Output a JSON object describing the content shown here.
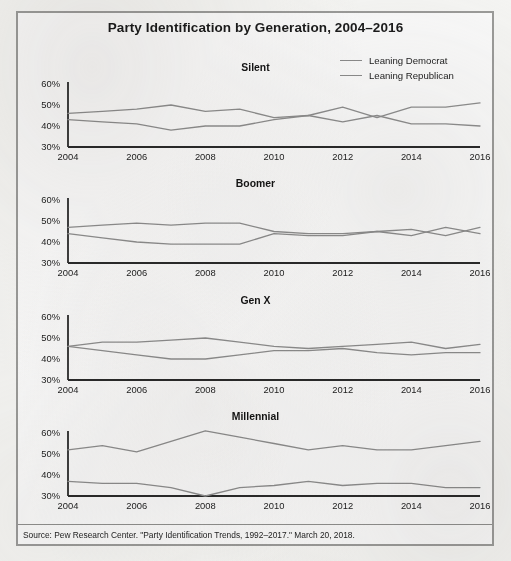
{
  "figure": {
    "title": "Party Identification by Generation, 2004–2016",
    "source": "Source: Pew Research Center. \"Party Identification Trends, 1992–2017.\" March 20, 2018."
  },
  "legend": {
    "items": [
      {
        "label": "Leaning Democrat",
        "color": "#8b8b8b"
      },
      {
        "label": "Leaning Republican",
        "color": "#8b8b8b"
      }
    ]
  },
  "chart_data": {
    "type": "line",
    "title": "Party Identification by Generation, 2004–2016",
    "xlabel": "",
    "ylabel": "",
    "xlim": [
      2004,
      2016
    ],
    "ylim": [
      30,
      60
    ],
    "yticks": [
      "30%",
      "40%",
      "50%",
      "60%"
    ],
    "ytick_values": [
      30,
      40,
      50,
      60
    ],
    "xticks": [
      "2004",
      "2006",
      "2008",
      "2010",
      "2012",
      "2014",
      "2016"
    ],
    "xtick_values": [
      2004,
      2006,
      2008,
      2010,
      2012,
      2014,
      2016
    ],
    "x": [
      2004,
      2005,
      2006,
      2007,
      2008,
      2009,
      2010,
      2011,
      2012,
      2013,
      2014,
      2015,
      2016
    ],
    "grid": false,
    "legend_position": "top-right",
    "panels": [
      {
        "name": "Silent",
        "series": [
          {
            "name": "Leaning Democrat",
            "values": [
              46,
              47,
              48,
              50,
              47,
              48,
              44,
              45,
              42,
              45,
              41,
              41,
              40
            ]
          },
          {
            "name": "Leaning Republican",
            "values": [
              43,
              42,
              41,
              38,
              40,
              40,
              43,
              45,
              49,
              44,
              49,
              49,
              51
            ]
          }
        ]
      },
      {
        "name": "Boomer",
        "series": [
          {
            "name": "Leaning Democrat",
            "values": [
              47,
              48,
              49,
              48,
              49,
              49,
              45,
              44,
              44,
              45,
              46,
              43,
              47
            ]
          },
          {
            "name": "Leaning Republican",
            "values": [
              44,
              42,
              40,
              39,
              39,
              39,
              44,
              43,
              43,
              45,
              43,
              47,
              44
            ]
          }
        ]
      },
      {
        "name": "Gen X",
        "series": [
          {
            "name": "Leaning Democrat",
            "values": [
              46,
              48,
              48,
              49,
              50,
              48,
              46,
              45,
              46,
              47,
              48,
              45,
              47
            ]
          },
          {
            "name": "Leaning Republican",
            "values": [
              46,
              44,
              42,
              40,
              40,
              42,
              44,
              44,
              45,
              43,
              42,
              43,
              43
            ]
          }
        ]
      },
      {
        "name": "Millennial",
        "series": [
          {
            "name": "Leaning Democrat",
            "values": [
              52,
              54,
              51,
              56,
              61,
              58,
              55,
              52,
              54,
              52,
              52,
              54,
              56
            ]
          },
          {
            "name": "Leaning Republican",
            "values": [
              37,
              36,
              36,
              34,
              30,
              34,
              35,
              37,
              35,
              36,
              36,
              34,
              34
            ]
          }
        ]
      }
    ]
  }
}
